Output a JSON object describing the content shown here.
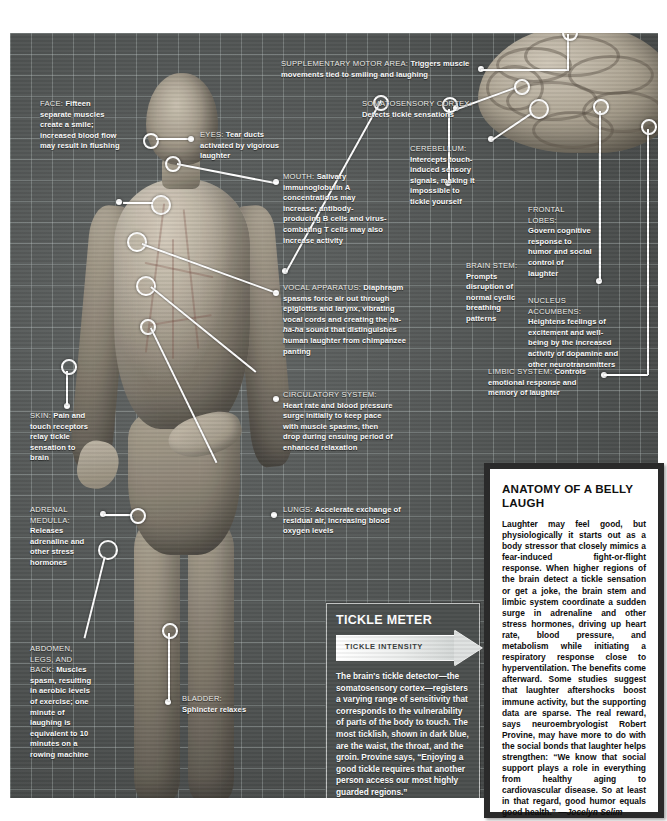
{
  "poster": {
    "title": "Anatomy of a Belly Laugh infographic"
  },
  "callouts": [
    {
      "id": "face",
      "header": "FACE:",
      "body": "Fifteen separate muscles create a smile; increased blood flow may result in flushing"
    },
    {
      "id": "eyes",
      "header": "EYES:",
      "body": "Tear ducts activated by vigorous laughter"
    },
    {
      "id": "mouth",
      "header": "MOUTH:",
      "body": "Salivary immunoglobulin A concentrations may increase; antibody-producing B cells and virus-combating T cells may also increase activity"
    },
    {
      "id": "vocal-apparatus",
      "header": "VOCAL APPARATUS:",
      "body_pre": "Diaphragm spasms force air out through epiglottis and larynx, vibrating vocal cords and creating the ",
      "body_italic": "ha-ha-ha",
      "body_post": " sound that distinguishes human laughter from chimpanzee panting"
    },
    {
      "id": "circulatory-system",
      "header": "CIRCULATORY SYSTEM:",
      "body": "Heart rate and blood pressure surge initially to keep pace with muscle spasms, then drop during ensuing period of enhanced relaxation"
    },
    {
      "id": "lungs",
      "header": "LUNGS:",
      "body": "Accelerate exchange of residual air, increasing blood oxygen levels"
    },
    {
      "id": "skin",
      "header": "SKIN:",
      "body": "Pain and touch receptors relay tickle sensation to brain"
    },
    {
      "id": "adrenal-medulla",
      "header": "ADRENAL MEDULLA:",
      "body": "Releases adrenaline and other stress hormones"
    },
    {
      "id": "abdomen-legs-back",
      "header": "ABDOMEN, LEGS, AND BACK:",
      "body": "Muscles spasm, resulting in aerobic levels of exercise; one minute of laughing is equivalent to 10 minutes on a rowing machine"
    },
    {
      "id": "bladder",
      "header": "BLADDER:",
      "body": "Sphincter relaxes"
    },
    {
      "id": "supplementary-motor-area",
      "header": "SUPPLEMENTARY MOTOR AREA:",
      "body": "Triggers muscle movements tied to smiling and laughing"
    },
    {
      "id": "somatosensory-cortex",
      "header": "SOMATOSENSORY CORTEX:",
      "body": "Detects tickle sensations"
    },
    {
      "id": "cerebellum",
      "header": "CEREBELLUM:",
      "body": "Intercepts touch-induced sensory signals, making it impossible to tickle yourself"
    },
    {
      "id": "brain-stem",
      "header": "BRAIN STEM:",
      "body": "Prompts disruption of normal cyclic breathing patterns"
    },
    {
      "id": "frontal-lobes",
      "header": "FRONTAL LOBES:",
      "body": "Govern cognitive response to humor and social control of laughter"
    },
    {
      "id": "nucleus-accumbens",
      "header": "NUCLEUS ACCUMBENS:",
      "body": "Heightens feelings of excitement and well-being by the increased activity of dopamine and other neurotransmitters"
    },
    {
      "id": "limbic-system",
      "header": "LIMBIC SYSTEM:",
      "body": "Controls emotional response and memory of laughter"
    }
  ],
  "tickle_meter": {
    "title": "TICKLE METER",
    "intensity_label": "TICKLE INTENSITY",
    "body": "The brain's tickle detector—the somatosensory cortex—registers a varying range of sensitivity that corresponds to the vulnerability of parts of the body to touch. The most ticklish, shown in dark blue, are the waist, the throat, and the groin. Provine says, “Enjoying a good tickle requires that another person access our most highly guarded regions.”"
  },
  "belly_panel": {
    "title": "ANATOMY OF A BELLY LAUGH",
    "body": "Laughter may feel good, but physiologically it starts out as a body stressor that closely mimics a fear-induced fight-or-flight response. When higher regions of the brain detect a tickle sensation or get a joke, the brain stem and limbic system coordinate a sudden surge in adrenaline and other stress hormones, driving up heart rate, blood pressure, and metabolism while initiating a respiratory response close to hyperventilation. The benefits come afterward. Some studies suggest that laughter aftershocks boost immune activity, but the supporting data are sparse. The real reward, says neuroembryologist Robert Provine, may have more to do with the social bonds that laughter helps strengthen: “We know that social support plays a role in everything from healthy aging to cardiovascular disease. So at least in that regard, good humor equals good health.” ",
    "author": "—Jocelyn Selim"
  },
  "colors": {
    "grid_bg": "#5b5f5e",
    "grid_line": "#bec8c6",
    "panel_dark": "#2a2a2a",
    "panel_light": "#ffffff",
    "text_light": "#ffffff"
  }
}
